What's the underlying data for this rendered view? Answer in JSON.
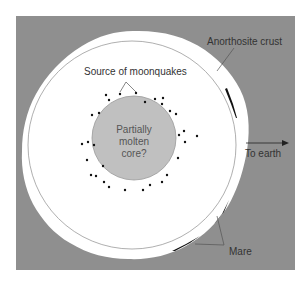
{
  "diagram": {
    "colors": {
      "background": "#8f8f8f",
      "mantle": "#ffffff",
      "core": "#c0c0c0",
      "mare": "#111111",
      "text": "#333333"
    },
    "labels": {
      "crust": "Anorthosite crust",
      "moonquakes": "Source of moonquakes",
      "core_line1": "Partially",
      "core_line2": "molten",
      "core_line3": "core?",
      "earth": "To earth",
      "mare": "Mare"
    }
  }
}
